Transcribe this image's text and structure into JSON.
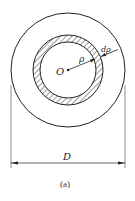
{
  "figure": {
    "caption": "(a)",
    "labels": {
      "center": "O",
      "radius": "ρ",
      "ring_width": "dρ",
      "diameter": "D"
    },
    "colors": {
      "stroke": "#222222",
      "background": "#ffffff"
    }
  }
}
